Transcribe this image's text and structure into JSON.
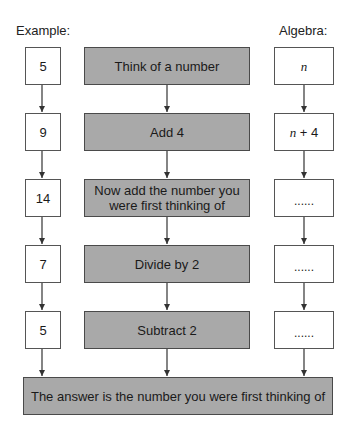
{
  "headers": {
    "example": "Example:",
    "algebra": "Algebra:"
  },
  "steps": [
    {
      "example": "5",
      "instruction": "Think of a number",
      "algebra_var": "n",
      "algebra_rest": ""
    },
    {
      "example": "9",
      "instruction": "Add 4",
      "algebra_var": "n",
      "algebra_rest": " + 4"
    },
    {
      "example": "14",
      "instruction_line1": "Now add the number you",
      "instruction_line2": "were first thinking of",
      "algebra_blank": "......"
    },
    {
      "example": "7",
      "instruction": "Divide by 2",
      "algebra_blank": "......"
    },
    {
      "example": "5",
      "instruction": "Subtract 2",
      "algebra_blank": "......"
    }
  ],
  "conclusion": "The answer is the number you were first thinking of",
  "colors": {
    "process_fill": "#a9a9a9",
    "border": "#555555",
    "arrow": "#333333"
  }
}
